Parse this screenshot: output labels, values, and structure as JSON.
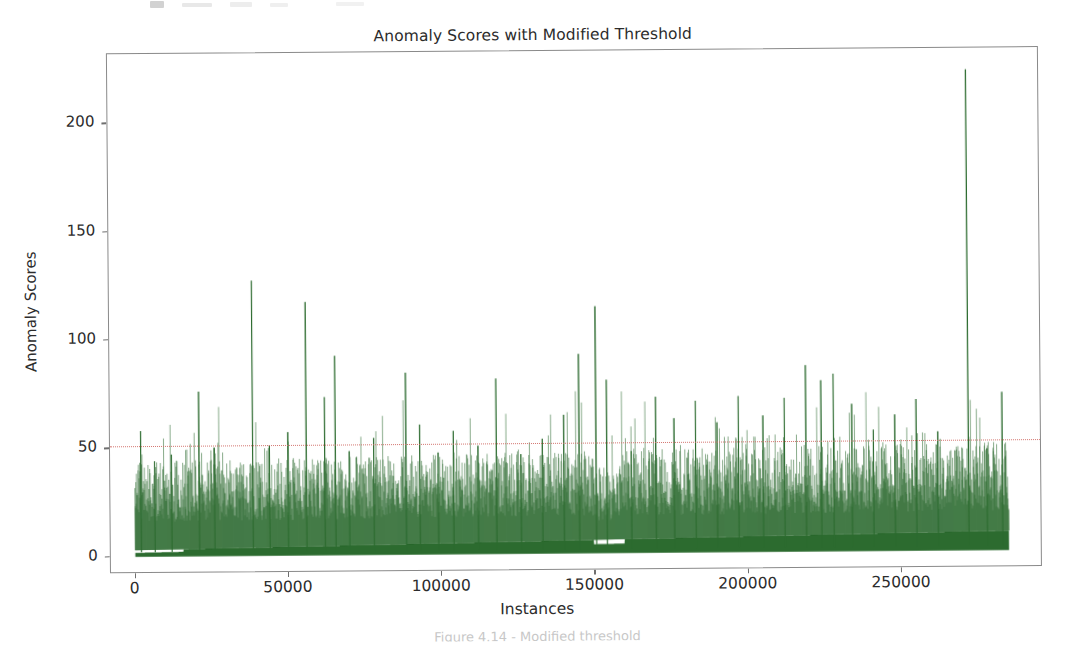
{
  "figure": {
    "caption": "Figure 4.14 - Modified threshold"
  },
  "chart_data": {
    "type": "line",
    "title": "Anomaly Scores with Modified Threshold",
    "xlabel": "Instances",
    "ylabel": "Anomaly Scores",
    "xlim": [
      -8000,
      296000
    ],
    "ylim": [
      -8,
      232
    ],
    "grid": false,
    "legend": null,
    "series_color": "#2c6b2f",
    "threshold": {
      "label": "Modified Threshold",
      "value": 51,
      "color": "#d06a63",
      "linestyle": "dotted"
    },
    "xticks": [
      0,
      50000,
      100000,
      150000,
      200000,
      250000
    ],
    "xtick_labels": [
      "0",
      "50000",
      "100000",
      "150000",
      "200000",
      "250000"
    ],
    "yticks": [
      0,
      50,
      100,
      150,
      200
    ],
    "ytick_labels": [
      "0",
      "50",
      "100",
      "150",
      "200"
    ],
    "x_data_range": [
      0,
      285000
    ],
    "baseline_band": [
      3,
      9
    ],
    "noise_band": [
      16,
      34
    ],
    "series_name": "Anomaly Scores",
    "max_value": 222,
    "max_value_x": 272000,
    "notable_peaks": [
      {
        "x": 2000,
        "y": 58
      },
      {
        "x": 6500,
        "y": 44
      },
      {
        "x": 12000,
        "y": 47
      },
      {
        "x": 21000,
        "y": 76
      },
      {
        "x": 26000,
        "y": 50
      },
      {
        "x": 38500,
        "y": 127
      },
      {
        "x": 44000,
        "y": 51
      },
      {
        "x": 50000,
        "y": 57
      },
      {
        "x": 56000,
        "y": 117
      },
      {
        "x": 62000,
        "y": 73
      },
      {
        "x": 65500,
        "y": 92
      },
      {
        "x": 70000,
        "y": 48
      },
      {
        "x": 78000,
        "y": 54
      },
      {
        "x": 88500,
        "y": 84
      },
      {
        "x": 93000,
        "y": 60
      },
      {
        "x": 99000,
        "y": 47
      },
      {
        "x": 104000,
        "y": 57
      },
      {
        "x": 112000,
        "y": 50
      },
      {
        "x": 118000,
        "y": 81
      },
      {
        "x": 126000,
        "y": 46
      },
      {
        "x": 133000,
        "y": 53
      },
      {
        "x": 140000,
        "y": 64
      },
      {
        "x": 145000,
        "y": 92
      },
      {
        "x": 150500,
        "y": 114
      },
      {
        "x": 154000,
        "y": 80
      },
      {
        "x": 162000,
        "y": 47
      },
      {
        "x": 170000,
        "y": 72
      },
      {
        "x": 176000,
        "y": 62
      },
      {
        "x": 183000,
        "y": 70
      },
      {
        "x": 190000,
        "y": 60
      },
      {
        "x": 197000,
        "y": 72
      },
      {
        "x": 205000,
        "y": 63
      },
      {
        "x": 212000,
        "y": 71
      },
      {
        "x": 219000,
        "y": 86
      },
      {
        "x": 224000,
        "y": 79
      },
      {
        "x": 228000,
        "y": 82
      },
      {
        "x": 234000,
        "y": 68
      },
      {
        "x": 241000,
        "y": 56
      },
      {
        "x": 248000,
        "y": 63
      },
      {
        "x": 255000,
        "y": 70
      },
      {
        "x": 262000,
        "y": 55
      },
      {
        "x": 272000,
        "y": 222
      },
      {
        "x": 278000,
        "y": 47
      },
      {
        "x": 283000,
        "y": 73
      }
    ]
  }
}
